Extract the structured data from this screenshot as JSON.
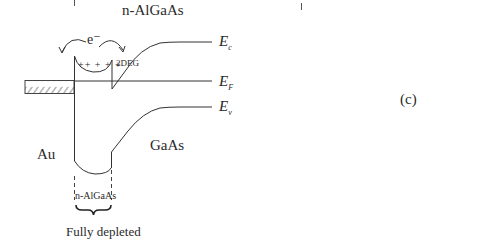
{
  "diagram": {
    "panel_label": "(c)",
    "title": "n-AlGaAs",
    "regions": {
      "metal": "Au",
      "substrate": "GaAs",
      "barrier": "n-AlGaAs"
    },
    "energy_levels": {
      "conduction": {
        "symbol": "E",
        "subscript": "c"
      },
      "fermi": {
        "symbol": "E",
        "subscript": "F"
      },
      "valence": {
        "symbol": "E",
        "subscript": "v"
      }
    },
    "annotations": {
      "electron": "e⁻",
      "two_deg": "2DEG",
      "donor_charges": "++ + + +",
      "depletion_note": "Fully depleted"
    },
    "colors": {
      "line": "#333333",
      "hatch": "#555555",
      "background": "#ffffff"
    }
  }
}
